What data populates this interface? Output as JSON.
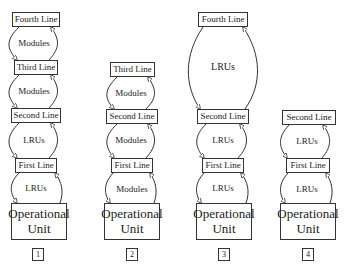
{
  "diagrams": [
    {
      "number": "1",
      "nodes": [
        "Fourth Line",
        "Third Line",
        "Second Line",
        "First Line"
      ],
      "operational_unit": [
        "Operational",
        "Unit"
      ],
      "edge_labels": [
        "Modules",
        "Modules",
        "LRUs",
        "LRUs"
      ]
    },
    {
      "number": "2",
      "nodes": [
        "Third Line",
        "Second Line",
        "First Line"
      ],
      "operational_unit": [
        "Operational",
        "Unit"
      ],
      "edge_labels": [
        "Modules",
        "Modules",
        "Modules"
      ]
    },
    {
      "number": "3",
      "nodes": [
        "Fourth Line",
        "Second Line",
        "First Line"
      ],
      "operational_unit": [
        "Operational",
        "Unit"
      ],
      "edge_labels": [
        "LRUs",
        "LRUs",
        "LRUs"
      ]
    },
    {
      "number": "4",
      "nodes": [
        "Second Line",
        "First Line"
      ],
      "operational_unit": [
        "Operational",
        "Unit"
      ],
      "edge_labels": [
        "LRUs",
        "LRUs"
      ]
    }
  ],
  "colors": {
    "stroke": "#333333",
    "background": "#ffffff"
  }
}
